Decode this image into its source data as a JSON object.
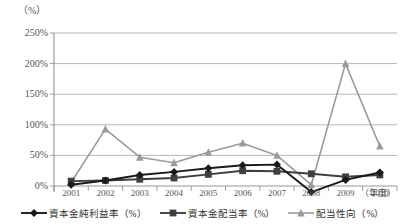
{
  "chart_data": {
    "type": "line",
    "title": "",
    "subtitle": "",
    "ylabel": "（%）",
    "xlabel": "（年度）",
    "categories": [
      "2001",
      "2002",
      "2003",
      "2004",
      "2005",
      "2006",
      "2007",
      "2008",
      "2009",
      "2010"
    ],
    "ylim": [
      0,
      250
    ],
    "yticks": [
      0,
      50,
      100,
      150,
      200,
      250
    ],
    "ytick_labels": [
      "0%",
      "50%",
      "100%",
      "150%",
      "200%",
      "250%"
    ],
    "grid": true,
    "legend_position": "bottom",
    "series": [
      {
        "name": "資本金純利益率（%）",
        "unit": "%",
        "color": "#1a1a1a",
        "marker": "diamond",
        "values": [
          2,
          9,
          18,
          23,
          29,
          34,
          35,
          -10,
          10,
          22
        ]
      },
      {
        "name": "資本金配当率（%）",
        "unit": "%",
        "color": "#3f3f3f",
        "marker": "square",
        "values": [
          8,
          9,
          11,
          13,
          19,
          25,
          24,
          20,
          15,
          18
        ]
      },
      {
        "name": "配当性向（%）",
        "unit": "%",
        "color": "#9b9b9b",
        "marker": "triangle",
        "values": [
          6,
          93,
          47,
          38,
          55,
          70,
          50,
          2,
          200,
          65
        ]
      }
    ]
  },
  "axis": {
    "unit_top_left": "（%）",
    "unit_bottom_right": "（年度）"
  }
}
